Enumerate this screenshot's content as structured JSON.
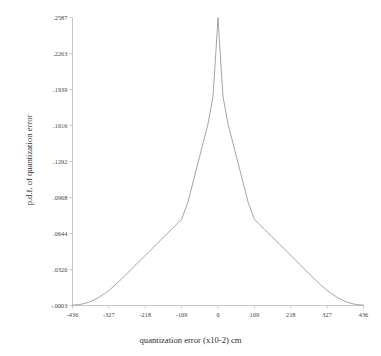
{
  "chart_data": {
    "type": "line",
    "title": "",
    "xlabel": "quantization error (x10-2) cm",
    "ylabel": "p.d.f. of quantization error",
    "grid": false,
    "legend": false,
    "xlim": [
      -436,
      436
    ],
    "ylim": [
      -0.0003,
      0.2587
    ],
    "xticks": [
      -436,
      -327,
      -218,
      -109,
      0,
      109,
      218,
      327,
      436
    ],
    "xtick_labels": [
      "-436",
      "-327",
      "-218",
      "-109",
      "0",
      "109",
      "218",
      "327",
      "436"
    ],
    "yticks": [
      -0.0003,
      0.032,
      0.0644,
      0.0968,
      0.1292,
      0.1616,
      0.1939,
      0.2263,
      0.2587
    ],
    "ytick_labels": [
      "-.0003",
      ".0320",
      ".0644",
      ".0968",
      ".1292",
      ".1616",
      ".1939",
      ".2263",
      ".2587"
    ],
    "series": [
      {
        "name": "p.d.f. of quantization error",
        "color": "#9a9a9a",
        "x": [
          -436,
          -420,
          -404,
          -388,
          -372,
          -356,
          -340,
          -327,
          -310,
          -294,
          -278,
          -262,
          -246,
          -230,
          -218,
          -200,
          -180,
          -160,
          -140,
          -120,
          -109,
          -90,
          -70,
          -50,
          -30,
          -15,
          -5,
          0,
          5,
          15,
          30,
          50,
          70,
          90,
          109,
          120,
          140,
          160,
          180,
          200,
          218,
          230,
          246,
          262,
          278,
          294,
          310,
          327,
          340,
          356,
          372,
          388,
          404,
          420,
          436
        ],
        "y": [
          0.0,
          0.0004,
          0.0012,
          0.0026,
          0.0046,
          0.0072,
          0.0104,
          0.0133,
          0.0176,
          0.0221,
          0.0268,
          0.0316,
          0.0364,
          0.0412,
          0.0448,
          0.0502,
          0.0561,
          0.0621,
          0.068,
          0.074,
          0.0772,
          0.0929,
          0.1162,
          0.1396,
          0.163,
          0.1875,
          0.234,
          0.2587,
          0.234,
          0.1875,
          0.163,
          0.1396,
          0.1162,
          0.0929,
          0.0772,
          0.074,
          0.068,
          0.0621,
          0.0561,
          0.0502,
          0.0448,
          0.0412,
          0.0364,
          0.0316,
          0.0268,
          0.0221,
          0.0176,
          0.0133,
          0.0104,
          0.0072,
          0.0046,
          0.0026,
          0.0012,
          0.0004,
          0.0
        ]
      }
    ],
    "peak": {
      "x": 0,
      "y": 0.2587
    },
    "axis_color": "#c8c8c8",
    "curve_color": "#9a9a9a",
    "background": "#ffffff"
  }
}
